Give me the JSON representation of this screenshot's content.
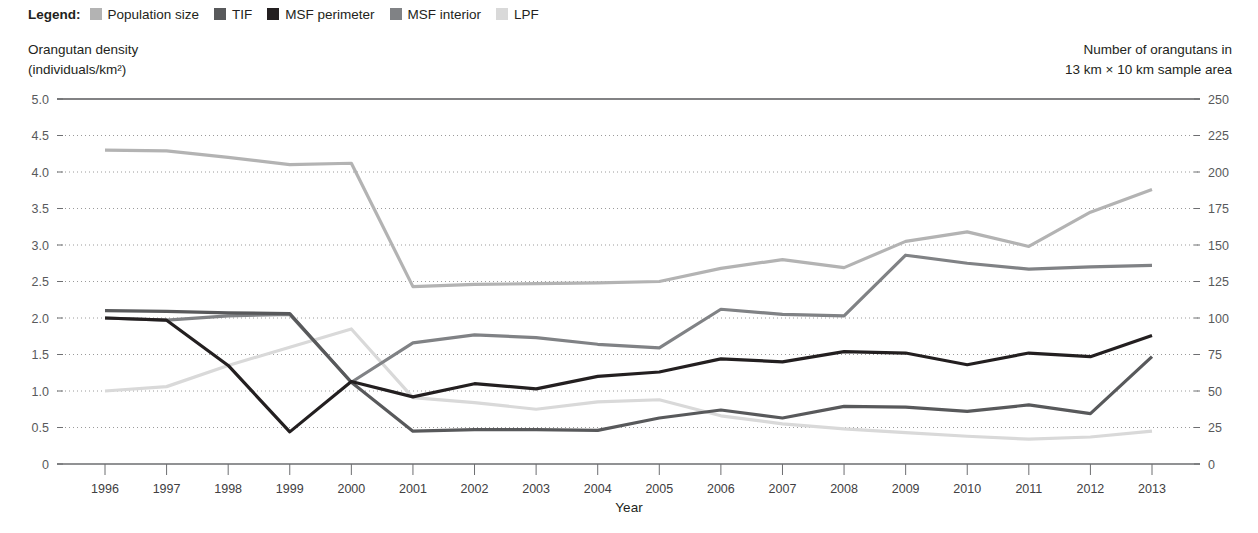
{
  "legend": {
    "title": "Legend:",
    "items": [
      {
        "label": "Population size",
        "color": "#b3b3b3",
        "key": "population_size"
      },
      {
        "label": "TIF",
        "color": "#58595b",
        "key": "tif"
      },
      {
        "label": "MSF perimeter",
        "color": "#231f20",
        "key": "msf_perimeter"
      },
      {
        "label": "MSF interior",
        "color": "#808285",
        "key": "msf_interior"
      },
      {
        "label": "LPF",
        "color": "#d9d9d9",
        "key": "lpf"
      }
    ]
  },
  "axes": {
    "y_left_caption_line1": "Orangutan density",
    "y_left_caption_line2": "(individuals/km²)",
    "y_right_caption_line1": "Number of orangutans in",
    "y_right_caption_line2": "13 km × 10 km sample area",
    "x_title": "Year",
    "y_left_ticks": [
      "5.0",
      "4.5",
      "4.0",
      "3.5",
      "3.0",
      "2.5",
      "2.0",
      "1.5",
      "1.0",
      "0.5",
      "0"
    ],
    "y_right_ticks": [
      "250",
      "225",
      "200",
      "175",
      "150",
      "125",
      "100",
      "75",
      "50",
      "25",
      "0"
    ]
  },
  "chart_data": {
    "type": "line",
    "title": "",
    "xlabel": "Year",
    "ylabel": "Orangutan density (individuals/km²)",
    "y2label": "Number of orangutans in 13 km × 10 km sample area",
    "ylim": [
      0,
      5.0
    ],
    "y2lim": [
      0,
      250
    ],
    "grid": true,
    "legend_position": "top-left",
    "x": [
      1996,
      1997,
      1998,
      1999,
      2000,
      2001,
      2002,
      2003,
      2004,
      2005,
      2006,
      2007,
      2008,
      2009,
      2010,
      2011,
      2012,
      2013
    ],
    "categories": [
      "1996",
      "1997",
      "1998",
      "1999",
      "2000",
      "2001",
      "2002",
      "2003",
      "2004",
      "2005",
      "2006",
      "2007",
      "2008",
      "2009",
      "2010",
      "2011",
      "2012",
      "2013"
    ],
    "series": [
      {
        "name": "Population size",
        "color": "#b3b3b3",
        "values": [
          4.3,
          4.29,
          4.2,
          4.1,
          4.12,
          2.43,
          2.46,
          2.47,
          2.48,
          2.5,
          2.68,
          2.8,
          2.69,
          3.05,
          3.18,
          2.98,
          3.45,
          3.76
        ]
      },
      {
        "name": "TIF",
        "color": "#58595b",
        "values": [
          2.1,
          2.09,
          2.07,
          2.06,
          1.12,
          0.45,
          0.47,
          0.47,
          0.46,
          0.63,
          0.74,
          0.63,
          0.79,
          0.78,
          0.72,
          0.81,
          0.69,
          1.47
        ]
      },
      {
        "name": "MSF perimeter",
        "color": "#231f20",
        "values": [
          2.0,
          1.97,
          1.35,
          0.44,
          1.13,
          0.92,
          1.1,
          1.03,
          1.2,
          1.26,
          1.44,
          1.4,
          1.54,
          1.52,
          1.36,
          1.52,
          1.47,
          1.76
        ]
      },
      {
        "name": "MSF interior",
        "color": "#808285",
        "values": [
          2.0,
          1.97,
          2.03,
          2.05,
          1.12,
          1.66,
          1.77,
          1.73,
          1.64,
          1.59,
          2.12,
          2.05,
          2.03,
          2.86,
          2.75,
          2.67,
          2.7,
          2.72
        ]
      },
      {
        "name": "LPF",
        "color": "#d9d9d9",
        "values": [
          1.0,
          1.06,
          1.35,
          1.6,
          1.85,
          0.91,
          0.84,
          0.75,
          0.85,
          0.88,
          0.66,
          0.55,
          0.48,
          0.43,
          0.38,
          0.34,
          0.37,
          0.45
        ]
      }
    ]
  }
}
